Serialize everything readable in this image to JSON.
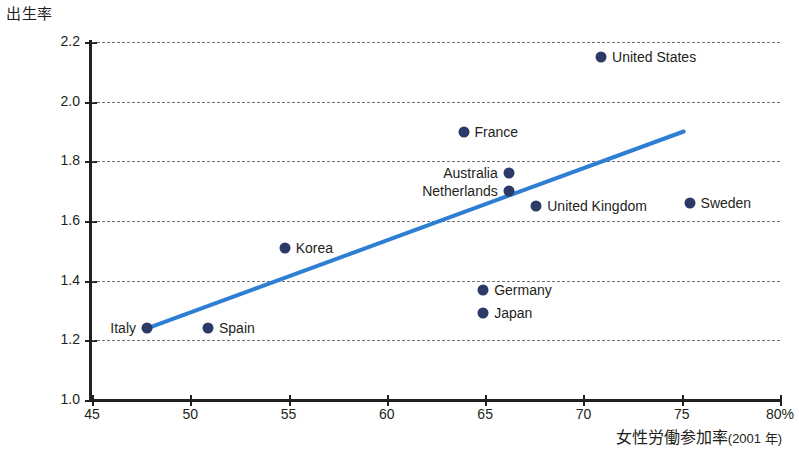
{
  "chart_data": {
    "type": "scatter",
    "title": "",
    "ylabel": "出生率",
    "xlabel": "女性労働参加率(2001 年)",
    "xlabel_main": "女性労働参加率",
    "xlabel_sub": "(2001 年)",
    "xlim": [
      45,
      80
    ],
    "ylim": [
      1.0,
      2.2
    ],
    "xticks": [
      "45",
      "50",
      "55",
      "60",
      "65",
      "70",
      "75",
      "80%"
    ],
    "xtick_values": [
      45,
      50,
      55,
      60,
      65,
      70,
      75,
      80
    ],
    "yticks": [
      "1.0",
      "1.2",
      "1.4",
      "1.6",
      "1.8",
      "2.0",
      "2.2"
    ],
    "ytick_values": [
      1.0,
      1.2,
      1.4,
      1.6,
      1.8,
      2.0,
      2.2
    ],
    "grid": true,
    "grid_axis": "y",
    "legend": "none",
    "point_color": "#2b3a67",
    "trendline_color": "#2e7fd4",
    "axis_color": "#231f20",
    "points": [
      {
        "label": "Italy",
        "x": 47.8,
        "y": 1.24,
        "label_side": "left"
      },
      {
        "label": "Spain",
        "x": 50.9,
        "y": 1.24,
        "label_side": "right"
      },
      {
        "label": "Korea",
        "x": 54.8,
        "y": 1.51,
        "label_side": "right"
      },
      {
        "label": "Germany",
        "x": 64.9,
        "y": 1.37,
        "label_side": "right"
      },
      {
        "label": "Japan",
        "x": 64.9,
        "y": 1.29,
        "label_side": "right"
      },
      {
        "label": "France",
        "x": 63.9,
        "y": 1.9,
        "label_side": "right"
      },
      {
        "label": "Australia",
        "x": 66.2,
        "y": 1.76,
        "label_side": "left"
      },
      {
        "label": "Netherlands",
        "x": 66.2,
        "y": 1.7,
        "label_side": "left"
      },
      {
        "label": "United Kingdom",
        "x": 67.6,
        "y": 1.65,
        "label_side": "right"
      },
      {
        "label": "Sweden",
        "x": 75.4,
        "y": 1.66,
        "label_side": "right"
      },
      {
        "label": "United States",
        "x": 70.9,
        "y": 2.15,
        "label_side": "right"
      }
    ],
    "trendline": {
      "x0": 47.8,
      "y0": 1.24,
      "x1": 75.1,
      "y1": 1.9
    }
  }
}
